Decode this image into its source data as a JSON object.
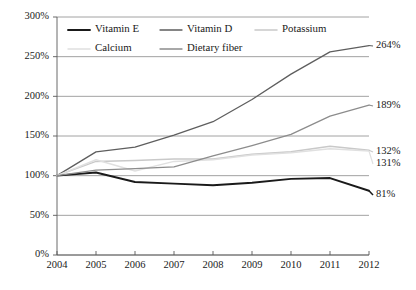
{
  "chart_data": {
    "type": "line",
    "title": "",
    "xlabel": "",
    "ylabel": "",
    "x": [
      2004,
      2005,
      2006,
      2007,
      2008,
      2009,
      2010,
      2011,
      2012
    ],
    "categories": [
      "2004",
      "2005",
      "2006",
      "2007",
      "2008",
      "2009",
      "2010",
      "2011",
      "2012"
    ],
    "xlim": [
      2004,
      2012
    ],
    "ylim": [
      0,
      300
    ],
    "yticks": [
      0,
      50,
      100,
      150,
      200,
      250,
      300
    ],
    "ytick_labels": [
      "0%",
      "50%",
      "100%",
      "150%",
      "200%",
      "250%",
      "300%"
    ],
    "xtick_labels": [
      "2004",
      "2005",
      "2006",
      "2007",
      "2008",
      "2009",
      "2010",
      "2011",
      "2012"
    ],
    "grid": true,
    "grid_axis": "y",
    "legend_position": "top-inside",
    "series": [
      {
        "name": "Vitamin E",
        "color": "#1a1a1a",
        "width": 1.9,
        "values": [
          100,
          104,
          92,
          90,
          88,
          91,
          96,
          97,
          81
        ],
        "end_label": "81%"
      },
      {
        "name": "Vitamin D",
        "color": "#5e5e5e",
        "width": 1.3,
        "values": [
          100,
          130,
          136,
          151,
          168,
          196,
          228,
          256,
          264
        ],
        "end_label": "264%"
      },
      {
        "name": "Potassium",
        "color": "#c9c9c9",
        "width": 1.5,
        "values": [
          100,
          118,
          119,
          121,
          121,
          127,
          130,
          137,
          132
        ],
        "end_label": "132%"
      },
      {
        "name": "Calcium",
        "color": "#e0e0e0",
        "width": 1.5,
        "values": [
          100,
          120,
          106,
          118,
          120,
          126,
          129,
          134,
          131
        ],
        "end_label": "131%"
      },
      {
        "name": "Dietary fiber",
        "color": "#8c8c8c",
        "width": 1.3,
        "values": [
          100,
          107,
          109,
          111,
          125,
          138,
          152,
          175,
          189
        ],
        "end_label": "189%"
      }
    ],
    "end_labels": [
      "264%",
      "189%",
      "132%",
      "131%",
      "81%"
    ],
    "legend": [
      {
        "label": "Vitamin E",
        "color": "#1a1a1a",
        "width": 1.9
      },
      {
        "label": "Vitamin D",
        "color": "#5e5e5e",
        "width": 1.3
      },
      {
        "label": "Potassium",
        "color": "#c9c9c9",
        "width": 1.5
      },
      {
        "label": "Calcium",
        "color": "#e0e0e0",
        "width": 1.5
      },
      {
        "label": "Dietary fiber",
        "color": "#8c8c8c",
        "width": 1.3
      }
    ]
  }
}
